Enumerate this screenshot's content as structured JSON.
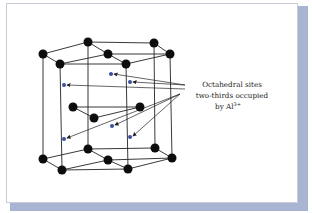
{
  "figure": {
    "label_lines": [
      "Octahedral sites",
      "two-thirds occupied",
      "by Al"
    ],
    "superscript": "3+",
    "colors": {
      "atom": "#0d0d0d",
      "site": "#3b4f9c",
      "line": "#222222",
      "shadow": "#a9b3d2",
      "border": "#c9ccd6"
    }
  }
}
